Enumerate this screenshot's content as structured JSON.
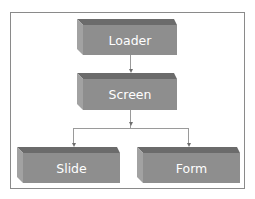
{
  "diagram": {
    "type": "hierarchy",
    "nodes": [
      {
        "id": "loader",
        "label": "Loader"
      },
      {
        "id": "screen",
        "label": "Screen"
      },
      {
        "id": "slide",
        "label": "Slide"
      },
      {
        "id": "form",
        "label": "Form"
      }
    ],
    "edges": [
      {
        "from": "Loader",
        "to": "Screen"
      },
      {
        "from": "Screen",
        "to": "Slide"
      },
      {
        "from": "Screen",
        "to": "Form"
      }
    ],
    "colors": {
      "box_front": "#8e8e8e",
      "box_top": "#6b6b6b",
      "box_side": "#a2a2a2",
      "label_text": "#ffffff",
      "connector": "#9a9a9a",
      "frame_border": "#8a8a8a"
    }
  }
}
